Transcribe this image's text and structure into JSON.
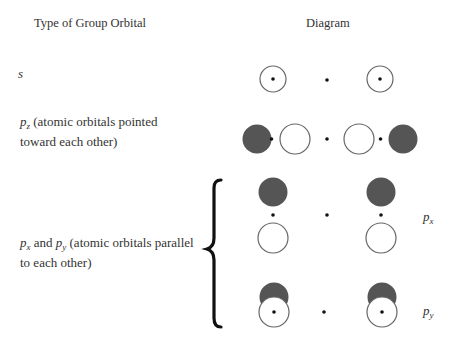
{
  "headers": {
    "type_column": "Type of Group Orbital",
    "diagram_column": "Diagram"
  },
  "rows": [
    {
      "id": "s",
      "symbol": "s",
      "description": ""
    },
    {
      "id": "pz",
      "symbol": "p",
      "subscript": "z",
      "description_line1": " (atomic orbitals pointed",
      "description_line2": "toward each other)"
    },
    {
      "id": "px_py",
      "symbol_a": "p",
      "subscript_a": "x",
      "joiner": " and ",
      "symbol_b": "p",
      "subscript_b": "y",
      "description_line1": " (atomic orbitals parallel",
      "description_line2": "to each other)"
    }
  ],
  "side_labels": {
    "px": {
      "symbol": "p",
      "subscript": "x"
    },
    "py": {
      "symbol": "p",
      "subscript": "y"
    }
  },
  "colors": {
    "shaded_lobe": "#555555",
    "outline": "#666666",
    "nucleus": "#111111",
    "brace": "#111111"
  }
}
